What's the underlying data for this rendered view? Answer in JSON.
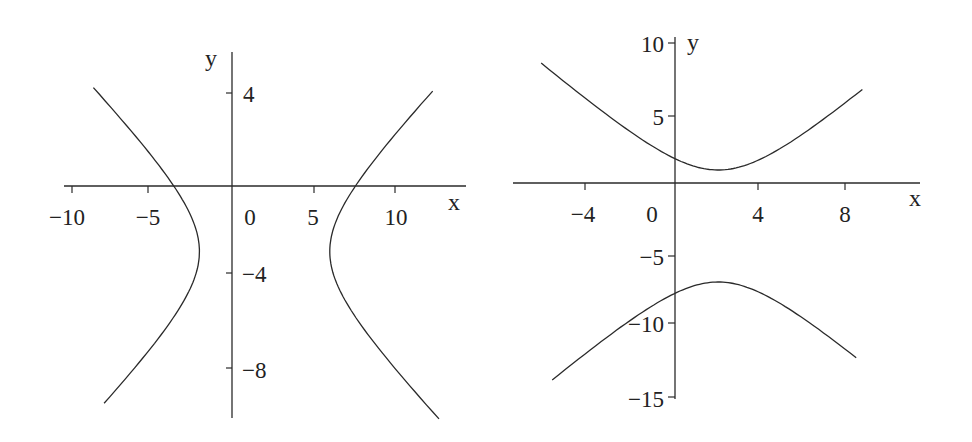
{
  "chart_data": [
    {
      "type": "line",
      "title": "",
      "xlabel": "x",
      "ylabel": "y",
      "equation": "(x-2)^2/16 - (y+3)^2/9 = 1",
      "center": [
        2,
        -3
      ],
      "vertices": [
        [
          -2,
          -3
        ],
        [
          6,
          -3
        ]
      ],
      "xticks": [
        -10,
        -5,
        0,
        5,
        10
      ],
      "xtick_labels": [
        "−10",
        "−5",
        "0",
        "5",
        "10"
      ],
      "yticks": [
        4,
        -4,
        -8
      ],
      "ytick_labels": [
        "4",
        "−4",
        "−8"
      ],
      "xlim": [
        -10.5,
        13.5
      ],
      "ylim": [
        -11,
        5.8
      ],
      "grid": false,
      "legend": "none",
      "series": [
        {
          "name": "left branch",
          "x": [
            -8.9,
            -6,
            -4,
            -2.6,
            -2,
            -2.6,
            -4,
            -6,
            -7.9
          ],
          "y": [
            2.2,
            -0.6,
            -1.6,
            -2.0,
            -3,
            -4.0,
            -4.4,
            -5.4,
            -9.8
          ]
        },
        {
          "name": "right branch",
          "x": [
            12.9,
            10,
            8,
            6.6,
            6,
            6.6,
            8,
            10,
            11.9
          ],
          "y": [
            5.4,
            1.6,
            1.0,
            -1.0,
            -3,
            -5.0,
            -6.0,
            -8.0,
            -10.4
          ]
        }
      ]
    },
    {
      "type": "line",
      "title": "",
      "xlabel": "x",
      "ylabel": "y",
      "equation": "(y+3)^2/16 - (x-2)^2/9 = 1",
      "center": [
        2,
        -3
      ],
      "vertices": [
        [
          2,
          1
        ],
        [
          2,
          -7
        ]
      ],
      "xticks": [
        -4,
        0,
        4,
        8
      ],
      "xtick_labels": [
        "−4",
        "0",
        "4",
        "8"
      ],
      "yticks": [
        10,
        5,
        -5,
        -10,
        -15
      ],
      "ytick_labels": [
        "10",
        "5",
        "−5",
        "−10",
        "−15"
      ],
      "xlim": [
        -7.5,
        11.4
      ],
      "ylim": [
        -15.2,
        10.2
      ],
      "grid": false,
      "legend": "none",
      "series": [
        {
          "name": "upper branch",
          "x": [
            -7.3,
            -4,
            0,
            2,
            4,
            8,
            11
          ],
          "y": [
            10.0,
            5.9,
            1.8,
            1.0,
            1.8,
            5.9,
            9.6
          ]
        },
        {
          "name": "lower branch",
          "x": [
            -6.6,
            -4,
            0,
            2,
            4,
            8,
            10.1
          ],
          "y": [
            -14.7,
            -11.9,
            -7.8,
            -7.0,
            -7.8,
            -11.9,
            -15.2
          ]
        }
      ]
    }
  ],
  "plots": [
    {
      "id": "left",
      "px": {
        "x0": 232,
        "y0": 184,
        "sx": 16.3,
        "sy": 22.5
      },
      "xaxis": {
        "x1": 64,
        "x2": 466,
        "y": 186
      },
      "yaxis": {
        "x": 232,
        "y1": 52,
        "y2": 418
      },
      "xlabel": "x",
      "ylabel": "y",
      "hyperbola": {
        "orientation": "horizontal",
        "h": 2,
        "k": -3,
        "a": 4,
        "b": 3,
        "tmin": -1.62,
        "tmax": 1.62,
        "tlim": [
          [
            -1.52,
            1.62
          ],
          [
            -1.6,
            1.57
          ]
        ]
      }
    },
    {
      "id": "right",
      "px": {
        "x0": 675,
        "y0": 184,
        "sx": 21.6,
        "sy": 14.0
      },
      "xaxis": {
        "x1": 513,
        "x2": 920,
        "y": 183
      },
      "yaxis": {
        "x": 675,
        "y1": 37,
        "y2": 399
      },
      "xlabel": "x",
      "ylabel": "y",
      "hyperbola": {
        "orientation": "vertical",
        "h": 2,
        "k": -3,
        "a": 4,
        "b": 3
      }
    }
  ]
}
